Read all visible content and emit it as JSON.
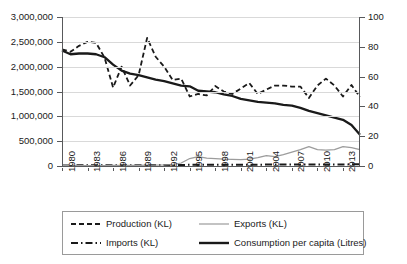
{
  "chart_data": {
    "type": "line",
    "title": "",
    "xlabel": "",
    "ylabel": "",
    "y2label": "",
    "grid": true,
    "legend_position": "bottom",
    "xlim": [
      1980,
      2015
    ],
    "ylim": [
      0,
      3000000
    ],
    "y2lim": [
      0,
      100
    ],
    "x": [
      1980,
      1981,
      1982,
      1983,
      1984,
      1985,
      1986,
      1987,
      1988,
      1989,
      1990,
      1991,
      1992,
      1993,
      1994,
      1995,
      1996,
      1997,
      1998,
      1999,
      2000,
      2001,
      2002,
      2003,
      2004,
      2005,
      2006,
      2007,
      2008,
      2009,
      2010,
      2011,
      2012,
      2013,
      2014,
      2015
    ],
    "x_tick_labels": [
      "1980",
      "1983",
      "1986",
      "1989",
      "1992",
      "1995",
      "1998",
      "2001",
      "2004",
      "2007",
      "2010",
      "2013"
    ],
    "y_tick_labels": [
      "0",
      "500,000",
      "1,000,000",
      "1,500,000",
      "2,000,000",
      "2,500,000",
      "3,000,000"
    ],
    "y2_tick_labels": [
      "0",
      "20",
      "40",
      "60",
      "80",
      "100"
    ],
    "series": [
      {
        "name": "Production (KL)",
        "axis": "left",
        "style": "dashed",
        "color": "#1a1a1a",
        "values": [
          2350000,
          2300000,
          2420000,
          2500000,
          2480000,
          2180000,
          1580000,
          2000000,
          1620000,
          1830000,
          2580000,
          2200000,
          2000000,
          1730000,
          1760000,
          1400000,
          1450000,
          1420000,
          1610000,
          1500000,
          1450000,
          1560000,
          1670000,
          1450000,
          1540000,
          1620000,
          1620000,
          1600000,
          1600000,
          1370000,
          1620000,
          1760000,
          1620000,
          1400000,
          1630000,
          1390000
        ]
      },
      {
        "name": "Imports (KL)",
        "axis": "left",
        "style": "dashdot",
        "color": "#1a1a1a",
        "values": [
          12000,
          12000,
          13000,
          13000,
          14000,
          14000,
          15000,
          15000,
          16000,
          17000,
          18000,
          19000,
          20000,
          21000,
          22000,
          23000,
          24000,
          24000,
          25000,
          25000,
          26000,
          26000,
          27000,
          27000,
          28000,
          28000,
          29000,
          29000,
          30000,
          30000,
          31000,
          31000,
          32000,
          32000,
          33000,
          33000
        ]
      },
      {
        "name": "Exports (KL)",
        "axis": "left",
        "style": "solid-thin",
        "color": "#9c9c9c",
        "values": [
          8000,
          8000,
          9000,
          9000,
          10000,
          10000,
          11000,
          12000,
          13000,
          14000,
          16000,
          18000,
          22000,
          30000,
          60000,
          150000,
          190000,
          160000,
          150000,
          140000,
          135000,
          130000,
          140000,
          170000,
          210000,
          190000,
          230000,
          280000,
          330000,
          390000,
          330000,
          320000,
          330000,
          390000,
          370000,
          330000
        ]
      },
      {
        "name": "Consumption per capita (Litres)",
        "axis": "right",
        "style": "solid-thick",
        "color": "#1a1a1a",
        "values": [
          77.5,
          75.0,
          75.5,
          75.5,
          75.0,
          73.0,
          68.0,
          64.0,
          62.0,
          61.0,
          59.5,
          58.0,
          57.0,
          55.5,
          54.0,
          53.5,
          50.5,
          50.0,
          49.5,
          48.0,
          47.0,
          45.0,
          44.0,
          43.0,
          42.5,
          42.0,
          41.0,
          40.5,
          39.0,
          37.0,
          35.5,
          34.0,
          32.5,
          31.0,
          27.5,
          21.0
        ]
      }
    ]
  },
  "legend": {
    "entries": [
      {
        "label": "Production (KL)",
        "swatch": "dashed-line-swatch"
      },
      {
        "label": "Exports (KL)",
        "swatch": "thin-gray-line-swatch"
      },
      {
        "label": "Imports (KL)",
        "swatch": "dashdot-line-swatch"
      },
      {
        "label": "Consumption per capita (Litres)",
        "swatch": "thick-black-line-swatch"
      }
    ]
  }
}
